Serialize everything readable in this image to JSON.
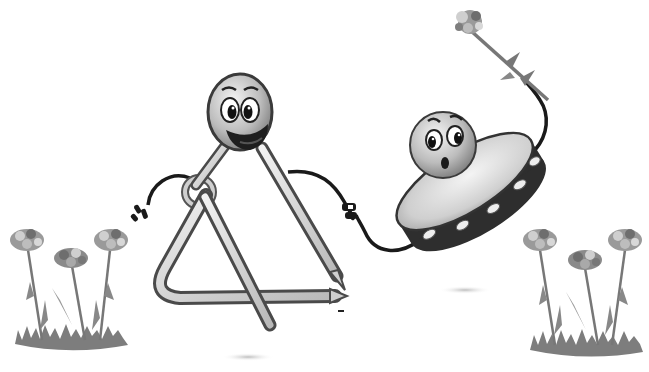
{
  "image": {
    "description": "Grayscale cartoon illustration of a smiling triangle musical instrument and a surprised tambourine character holding a carnation, flanked by two bunches of carnations on grass",
    "width": 649,
    "height": 372,
    "background": "#ffffff"
  },
  "top_edge_text": {
    "visible": true,
    "content": "",
    "note": "clipped line of text at very top edge, unreadable"
  },
  "figures": {
    "triangle": {
      "label": "Smiling triangle character",
      "face": "happy",
      "holds": "striker rod",
      "colors": {
        "metal": "#d8d8d8",
        "outline": "#4a4a4a",
        "face": "#bdbdbd",
        "mouth": "#222222"
      }
    },
    "tambourine": {
      "label": "Surprised tambourine character",
      "face": "surprised",
      "holds": "carnation",
      "colors": {
        "head": "#e2e2e2",
        "rim": "#2f2f2f",
        "jingles": "#e8e8e8",
        "face": "#c4c4c4"
      }
    },
    "flowers_left": {
      "label": "Carnations left",
      "count": 3
    },
    "flowers_right": {
      "label": "Carnations right",
      "count": 3
    },
    "flower_colors": {
      "petals_light": "#cfcfcf",
      "petals_mid": "#9a9a9a",
      "petals_dark": "#6e6e6e",
      "stem": "#777777",
      "grass": "#7d7d7d"
    }
  }
}
